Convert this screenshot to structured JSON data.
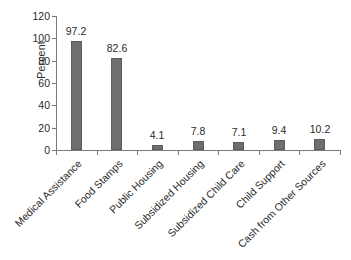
{
  "chart_data": {
    "type": "bar",
    "title": "",
    "xlabel": "",
    "ylabel": "Percent",
    "ylim": [
      0,
      120
    ],
    "ytick_labels": [
      "120",
      "100",
      "80",
      "60",
      "40",
      "20",
      "0"
    ],
    "ytick_values": [
      120,
      100,
      80,
      60,
      40,
      20,
      0
    ],
    "grid": false,
    "legend": "none",
    "bar_color": "#6e6e6e",
    "categories": [
      "Medical Assistance",
      "Food Stamps",
      "Public Housing",
      "Subsidized Housing",
      "Subsidized Child Care",
      "Child Support",
      "Cash from Other Sources"
    ],
    "values": [
      97.2,
      82.6,
      4.1,
      7.8,
      7.1,
      9.4,
      10.2
    ],
    "value_labels": [
      "97.2",
      "82.6",
      "4.1",
      "7.8",
      "7.1",
      "9.4",
      "10.2"
    ]
  }
}
